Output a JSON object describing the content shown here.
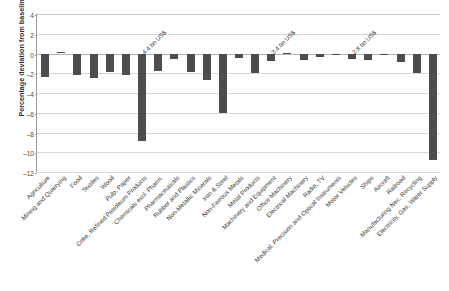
{
  "chart_data": {
    "type": "bar",
    "title": "",
    "xlabel": "",
    "ylabel": "Percentage deviation from baseline",
    "ylim": [
      -12,
      4
    ],
    "yticks": [
      4,
      2,
      0,
      -2,
      -4,
      -6,
      -8,
      -10,
      -12
    ],
    "ytick_labels": [
      "4",
      "2",
      "0",
      "–2",
      "–4",
      "–6",
      "–8",
      "–10",
      "–12"
    ],
    "grid": true,
    "legend": "none",
    "bar_color": "#4d4d4d",
    "categories": [
      "Agriculture",
      "Mining and Quarrying",
      "Food",
      "Textiles",
      "Wood",
      "Pulp, Paper",
      "Coke, Refined Petroleum Products",
      "Chemicals excl. Pharm.",
      "Pharmaceuticals",
      "Rubber and Plastics",
      "Non-Metallic Minerals",
      "Iron & Steel",
      "Non-Ferrous Metals",
      "Metal Products",
      "Machinery and Equipment",
      "Office Machinery",
      "Electrical Machinery",
      "Radio, TV",
      "Medical, Precision and Optical Instruments",
      "Motor Vehicles",
      "Ships",
      "Aircraft",
      "Railroad",
      "Manufacturing Nec, Recycling",
      "Electricity, Gas, Water Supply"
    ],
    "values": [
      -2.4,
      0.15,
      -2.2,
      -2.45,
      -1.85,
      -2.2,
      -8.9,
      -1.8,
      -0.55,
      -1.85,
      -2.65,
      -6.0,
      -0.45,
      -1.95,
      -0.8,
      0.07,
      -0.65,
      -0.4,
      -0.07,
      -0.55,
      -0.65,
      -0.15,
      -0.9,
      -1.95,
      -10.8
    ],
    "annotations": [
      {
        "text": "–4.4 bn US$",
        "category": "Coke, Refined Petroleum Products"
      },
      {
        "text": "–3.4 bn US$",
        "category": "Machinery and Equipment"
      },
      {
        "text": "–2.8 bn US$",
        "category": "Motor Vehicles"
      }
    ]
  }
}
